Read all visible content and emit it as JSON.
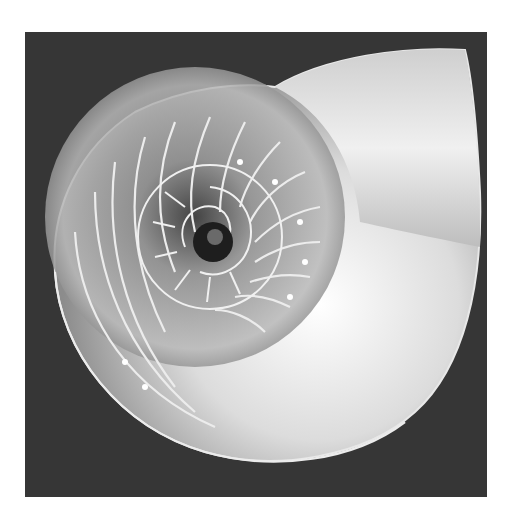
{
  "image": {
    "subject": "nautilus shell cross-section",
    "style": "grayscale photograph",
    "colors": {
      "page_background": "#ffffff",
      "photo_background": "#363636",
      "shell_light": "#f2f2f2",
      "shell_mid": "#9a9a9a",
      "shell_dark": "#3c3c3c",
      "septa_line": "#e8e8e8"
    }
  }
}
